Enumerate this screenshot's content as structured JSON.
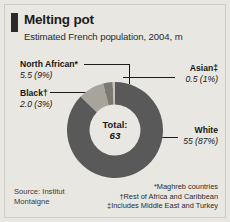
{
  "header": {
    "title": "Melting pot",
    "subtitle": "Estimated French population, 2004, m"
  },
  "center": {
    "total_label": "Total:",
    "total_value": "63"
  },
  "labels": {
    "north_african": {
      "category": "North African*",
      "value": "5.5 (9%)"
    },
    "black": {
      "category": "Black†",
      "value": "2.0 (3%)"
    },
    "asian": {
      "category": "Asian‡",
      "value": "0.5 (1%)"
    },
    "white": {
      "category": "White",
      "value": "55 (87%)"
    }
  },
  "source": "Source: Institut Montaigne",
  "footnotes": {
    "one": "*Maghreb countries",
    "two": "†Rest of Africa and Caribbean",
    "three": "‡Includes Middle East and Turkey"
  },
  "colors": {
    "background": "#e9e7e2",
    "white_segment": "#595959",
    "north_african_segment": "#a9a49b",
    "black_segment": "#7d7870",
    "asian_segment": "#c6c2ba",
    "marker": "#2b2b2b"
  },
  "chart_data": {
    "type": "pie",
    "title": "Melting pot",
    "subtitle": "Estimated French population, 2004, m",
    "categories": [
      "White",
      "North African*",
      "Black†",
      "Asian‡"
    ],
    "values": [
      55,
      5.5,
      2.0,
      0.5
    ],
    "percentages": [
      87,
      9,
      3,
      1
    ],
    "value_labels": [
      "55 (87%)",
      "5.5 (9%)",
      "2.0 (3%)",
      "0.5 (1%)"
    ],
    "total": 63,
    "total_label": "Total: 63",
    "unit": "m",
    "donut": true,
    "inner_radius_ratio": 0.53,
    "xlabel": "",
    "ylabel": "",
    "legend_position": "callout-labels",
    "grid": false,
    "annotations": [
      "*Maghreb countries",
      "†Rest of Africa and Caribbean",
      "‡Includes Middle East and Turkey",
      "Source: Institut Montaigne"
    ]
  }
}
